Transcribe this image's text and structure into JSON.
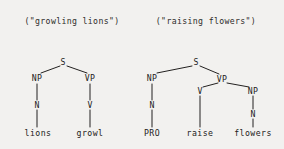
{
  "figure": {
    "background_color": "#f2f1ef",
    "ink_color": "#232120",
    "width": 284,
    "height": 149
  },
  "trees": [
    {
      "caption": "(\"growling lions\")",
      "caption_x": 72,
      "caption_y": 16,
      "nodes": [
        {
          "label": "S",
          "x": 63,
          "y": 62,
          "type": "nonterminal"
        },
        {
          "label": "NP",
          "x": 37,
          "y": 78,
          "type": "nonterminal"
        },
        {
          "label": "VP",
          "x": 90,
          "y": 78,
          "type": "nonterminal"
        },
        {
          "label": "N",
          "x": 37,
          "y": 105,
          "type": "nonterminal"
        },
        {
          "label": "V",
          "x": 90,
          "y": 105,
          "type": "nonterminal"
        },
        {
          "label": "lions",
          "x": 38,
          "y": 133,
          "type": "terminal"
        },
        {
          "label": "growl",
          "x": 90,
          "y": 133,
          "type": "terminal"
        }
      ],
      "edges": [
        {
          "x1": 60,
          "y1": 66,
          "x2": 41,
          "y2": 73
        },
        {
          "x1": 67,
          "y1": 66,
          "x2": 87,
          "y2": 73
        },
        {
          "x1": 37,
          "y1": 84,
          "x2": 37,
          "y2": 100
        },
        {
          "x1": 90,
          "y1": 84,
          "x2": 90,
          "y2": 100
        },
        {
          "x1": 37,
          "y1": 110,
          "x2": 37,
          "y2": 127
        },
        {
          "x1": 90,
          "y1": 110,
          "x2": 90,
          "y2": 127
        }
      ]
    },
    {
      "caption": "(\"raising flowers\")",
      "caption_x": 206,
      "caption_y": 16,
      "nodes": [
        {
          "label": "S",
          "x": 196,
          "y": 62,
          "type": "nonterminal"
        },
        {
          "label": "NP",
          "x": 152,
          "y": 78,
          "type": "nonterminal"
        },
        {
          "label": "VP",
          "x": 222,
          "y": 79,
          "type": "nonterminal"
        },
        {
          "label": "N",
          "x": 152,
          "y": 105,
          "type": "nonterminal"
        },
        {
          "label": "V",
          "x": 200,
          "y": 91,
          "type": "nonterminal"
        },
        {
          "label": "NP",
          "x": 253,
          "y": 91,
          "type": "nonterminal"
        },
        {
          "label": "N",
          "x": 253,
          "y": 114,
          "type": "nonterminal"
        },
        {
          "label": "PRO",
          "x": 152,
          "y": 133,
          "type": "terminal"
        },
        {
          "label": "raise",
          "x": 200,
          "y": 133,
          "type": "terminal"
        },
        {
          "label": "flowers",
          "x": 253,
          "y": 133,
          "type": "terminal"
        }
      ],
      "edges": [
        {
          "x1": 192,
          "y1": 66,
          "x2": 157,
          "y2": 73
        },
        {
          "x1": 200,
          "y1": 66,
          "x2": 219,
          "y2": 74
        },
        {
          "x1": 152,
          "y1": 84,
          "x2": 152,
          "y2": 100
        },
        {
          "x1": 152,
          "y1": 110,
          "x2": 152,
          "y2": 127
        },
        {
          "x1": 218,
          "y1": 83,
          "x2": 203,
          "y2": 87
        },
        {
          "x1": 227,
          "y1": 83,
          "x2": 249,
          "y2": 87
        },
        {
          "x1": 200,
          "y1": 96,
          "x2": 200,
          "y2": 127
        },
        {
          "x1": 253,
          "y1": 96,
          "x2": 253,
          "y2": 109
        },
        {
          "x1": 253,
          "y1": 119,
          "x2": 253,
          "y2": 127
        }
      ]
    }
  ]
}
